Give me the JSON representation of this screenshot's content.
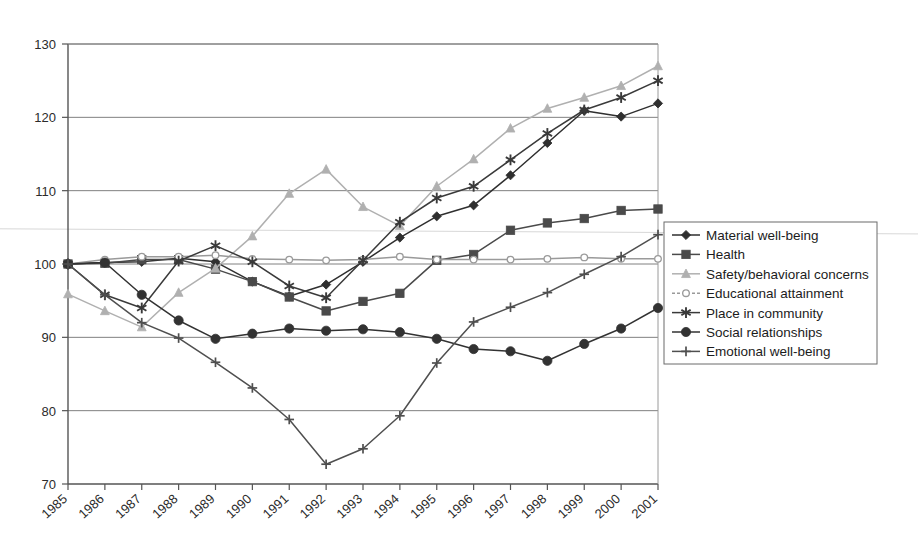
{
  "chart_data": {
    "type": "line",
    "title": "",
    "subtitle": "",
    "xlabel": "",
    "ylabel": "",
    "x": [
      1985,
      1986,
      1987,
      1988,
      1989,
      1990,
      1991,
      1992,
      1993,
      1994,
      1995,
      1996,
      1997,
      1998,
      1999,
      2000,
      2001
    ],
    "xtick_labels": [
      "1985",
      "1986",
      "1987",
      "1988",
      "1989",
      "1990",
      "1991",
      "1992",
      "1993",
      "1994",
      "1995",
      "1996",
      "1997",
      "1998",
      "1999",
      "2000",
      "2001"
    ],
    "ytick_labels": [
      "70",
      "80",
      "90",
      "100",
      "110",
      "120",
      "130"
    ],
    "yticks": [
      70,
      80,
      90,
      100,
      110,
      120,
      130
    ],
    "ylim": [
      70,
      130
    ],
    "xlim": [
      1985,
      2001
    ],
    "grid": "horizontal",
    "legend_position": "right",
    "series": [
      {
        "name": "Material well-being",
        "marker": "diamond",
        "color": "#2f2f2f",
        "values": [
          100.0,
          100.2,
          100.3,
          100.8,
          100.3,
          97.6,
          95.6,
          97.2,
          100.3,
          103.6,
          106.5,
          108.0,
          112.1,
          116.5,
          120.9,
          120.1,
          121.9
        ]
      },
      {
        "name": "Health",
        "marker": "square",
        "color": "#4a4a4a",
        "values": [
          100.0,
          100.1,
          100.6,
          100.6,
          99.3,
          97.6,
          95.5,
          93.6,
          94.9,
          96.0,
          100.5,
          101.3,
          104.6,
          105.6,
          106.2,
          107.3,
          107.5
        ]
      },
      {
        "name": "Safety/behavioral concerns",
        "marker": "triangle",
        "color": "#b0b0b0",
        "values": [
          95.9,
          93.6,
          91.4,
          96.1,
          99.4,
          103.8,
          109.6,
          112.9,
          107.8,
          105.2,
          110.6,
          114.3,
          118.5,
          121.2,
          122.7,
          124.3,
          127.0
        ]
      },
      {
        "name": "Educational attainment",
        "marker": "open-circle",
        "color": "#9a9a9a",
        "values": [
          100.0,
          100.6,
          101.0,
          101.0,
          101.2,
          100.7,
          100.6,
          100.5,
          100.6,
          101.0,
          100.6,
          100.6,
          100.6,
          100.7,
          100.9,
          100.7,
          100.7
        ]
      },
      {
        "name": "Place in community",
        "marker": "asterisk",
        "color": "#3a3a3a",
        "values": [
          100.0,
          95.8,
          94.0,
          100.4,
          102.5,
          100.3,
          97.0,
          95.4,
          100.5,
          105.7,
          109.0,
          110.6,
          114.2,
          117.8,
          121.0,
          122.7,
          125.0
        ]
      },
      {
        "name": "Social relationships",
        "marker": "filled-circle",
        "color": "#323232",
        "values": [
          100.0,
          100.2,
          95.8,
          92.3,
          89.8,
          90.5,
          91.2,
          90.9,
          91.1,
          90.7,
          89.8,
          88.4,
          88.1,
          86.8,
          89.1,
          91.2,
          94.0
        ]
      },
      {
        "name": "Emotional well-being",
        "marker": "plus",
        "color": "#4f4f4f",
        "values": [
          100.0,
          95.8,
          92.0,
          89.9,
          86.6,
          83.1,
          78.8,
          72.7,
          74.8,
          79.3,
          86.5,
          92.1,
          94.1,
          96.1,
          98.6,
          101.0,
          104.0
        ]
      }
    ]
  },
  "legend": {
    "items": [
      {
        "label": "Material well-being"
      },
      {
        "label": "Health"
      },
      {
        "label": "Safety/behavioral concerns"
      },
      {
        "label": "Educational attainment"
      },
      {
        "label": "Place in community"
      },
      {
        "label": "Social relationships"
      },
      {
        "label": "Emotional well-being"
      }
    ]
  }
}
